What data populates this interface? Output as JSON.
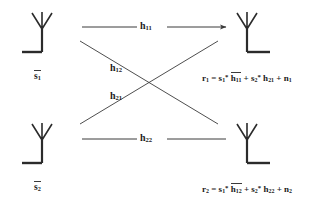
{
  "diagram": {
    "stroke_color": "#3a3a3a",
    "antenna_color": "#2b2b2b",
    "text_color": "#1a1a1a",
    "transmitters": [
      {
        "id": "tx1",
        "label_base": "s",
        "label_sub": "1",
        "overbar": true,
        "orientation": "base-left"
      },
      {
        "id": "tx2",
        "label_base": "s",
        "label_sub": "2",
        "overbar": true,
        "orientation": "base-left"
      }
    ],
    "receivers": [
      {
        "id": "rx1",
        "orientation": "base-right"
      },
      {
        "id": "rx2",
        "orientation": "base-right"
      }
    ],
    "channels": [
      {
        "id": "h11",
        "base": "h",
        "sub": "11",
        "from": "tx1",
        "to": "rx1",
        "style": "horizontal",
        "arrowhead": true
      },
      {
        "id": "h12",
        "base": "h",
        "sub": "12",
        "from": "tx1",
        "to": "rx2",
        "style": "diagonal",
        "arrowhead": false
      },
      {
        "id": "h21",
        "base": "h",
        "sub": "21",
        "from": "tx2",
        "to": "rx1",
        "style": "diagonal",
        "arrowhead": false
      },
      {
        "id": "h22",
        "base": "h",
        "sub": "22",
        "from": "tx2",
        "to": "rx2",
        "style": "horizontal",
        "arrowhead": false
      }
    ],
    "equations": [
      {
        "id": "r1",
        "lhs_base": "r",
        "lhs_sub": "1",
        "eq": "=",
        "t1_base": "s",
        "t1_sub": "1",
        "t1_star": "*",
        "t1_h_base": "h",
        "t1_h_sub": "11",
        "t1_h_overbar": true,
        "plus": "+",
        "t2_base": "s",
        "t2_sub": "2",
        "t2_star": "*",
        "t2_h_base": "h",
        "t2_h_sub": "21",
        "t2_h_overbar": false,
        "plus2": "+",
        "noise_base": "n",
        "noise_sub": "1"
      },
      {
        "id": "r2",
        "lhs_base": "r",
        "lhs_sub": "2",
        "eq": "=",
        "t1_base": "s",
        "t1_sub": "1",
        "t1_star": "*",
        "t1_h_base": "h",
        "t1_h_sub": "12",
        "t1_h_overbar": true,
        "plus": "+",
        "t2_base": "s",
        "t2_sub": "2",
        "t2_star": "*",
        "t2_h_base": "h",
        "t2_h_sub": "22",
        "t2_h_overbar": false,
        "plus2": "+",
        "noise_base": "n",
        "noise_sub": "2"
      }
    ]
  }
}
